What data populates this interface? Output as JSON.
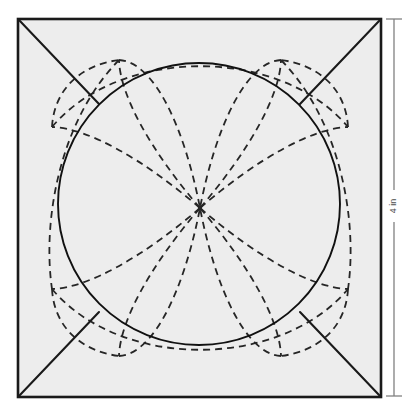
{
  "figure": {
    "background_color": "#ffffff",
    "fill_color": "#ededed",
    "stroke_color": "#1a1a1a",
    "dash_color": "#262626"
  },
  "square": {
    "name": "outer-square",
    "x": 18,
    "y": 19,
    "width": 363,
    "height": 378,
    "stroke_width": 2.6,
    "fill": "#ededed",
    "stroke": "#1a1a1a"
  },
  "circle": {
    "name": "inscribed-circle",
    "cx": 199,
    "cy": 204,
    "r": 141,
    "stroke_width": 1.9,
    "stroke": "#111111",
    "fill": "none"
  },
  "center_point": {
    "cx": 200,
    "cy": 208,
    "r": 2.2
  },
  "corner_diagonals": [
    {
      "name": "diagonal-top-left",
      "x1": 19,
      "y1": 20,
      "x2": 99,
      "y2": 104
    },
    {
      "name": "diagonal-top-right",
      "x1": 380,
      "y1": 20,
      "x2": 300,
      "y2": 104
    },
    {
      "name": "diagonal-bottom-right",
      "x1": 380,
      "y1": 396,
      "x2": 300,
      "y2": 312
    },
    {
      "name": "diagonal-bottom-left",
      "x1": 19,
      "y1": 396,
      "x2": 99,
      "y2": 312
    }
  ],
  "petal_arcs": {
    "stroke_width": 1.8,
    "dash_pattern": "7 5",
    "paths": [
      {
        "name": "arc-petal-upper-left-outer",
        "d": "M 200 208 C 150 150 120 95 119 60"
      },
      {
        "name": "arc-petal-upper-left-inner",
        "d": "M 119 60 C 155 62 185 130 200 208"
      },
      {
        "name": "arc-petal-upper-right-outer",
        "d": "M 200 208 C 250 150 280 95 281 60"
      },
      {
        "name": "arc-petal-upper-right-inner",
        "d": "M 281 60 C 245 62 215 130 200 208"
      },
      {
        "name": "arc-petal-lower-left-outer",
        "d": "M 200 208 C 150 266 120 321 119 356"
      },
      {
        "name": "arc-petal-lower-left-inner",
        "d": "M 119 356 C 155 354 185 286 200 208"
      },
      {
        "name": "arc-petal-lower-right-outer",
        "d": "M 200 208 C 250 266 280 321 281 356"
      },
      {
        "name": "arc-petal-lower-right-inner",
        "d": "M 281 356 C 245 354 215 286 200 208"
      },
      {
        "name": "arc-petal-left-upper",
        "d": "M 200 208 C 142 158 87 128 52 127"
      },
      {
        "name": "arc-petal-left-lower",
        "d": "M 200 208 C 142 258 87 288 52 289"
      },
      {
        "name": "arc-petal-right-upper",
        "d": "M 200 208 C 258 158 313 128 348 127"
      },
      {
        "name": "arc-petal-right-lower",
        "d": "M 200 208 C 258 258 313 288 348 289"
      },
      {
        "name": "arc-corner-tl-sweep",
        "d": "M 52 127 C 54 90 80 65 119 60"
      },
      {
        "name": "arc-corner-tr-sweep",
        "d": "M 348 127 C 346 90 320 65 281 60"
      },
      {
        "name": "arc-corner-bl-sweep",
        "d": "M 52 289 C 54 326 80 351 119 356"
      },
      {
        "name": "arc-corner-br-sweep",
        "d": "M 348 289 C 346 326 320 351 281 356"
      },
      {
        "name": "arc-big-top-left-to-bottom",
        "d": "M 119 60 C 60 120 42 220 52 289"
      },
      {
        "name": "arc-big-top-right-to-bottom",
        "d": "M 281 60 C 340 120 358 220 348 289"
      },
      {
        "name": "arc-big-left-to-right-top",
        "d": "M 52 127 C 120 46 280 46 348 127"
      },
      {
        "name": "arc-big-left-to-right-bot",
        "d": "M 52 289 C 120 370 280 370 348 289"
      }
    ]
  },
  "dimension": {
    "name": "height-dimension",
    "label": "4 in",
    "line_x": 394,
    "y_top": 19,
    "y_bottom": 396,
    "tick_half_width": 8,
    "stroke": "#808080",
    "label_gap_top": 190,
    "label_gap_bottom": 222
  }
}
